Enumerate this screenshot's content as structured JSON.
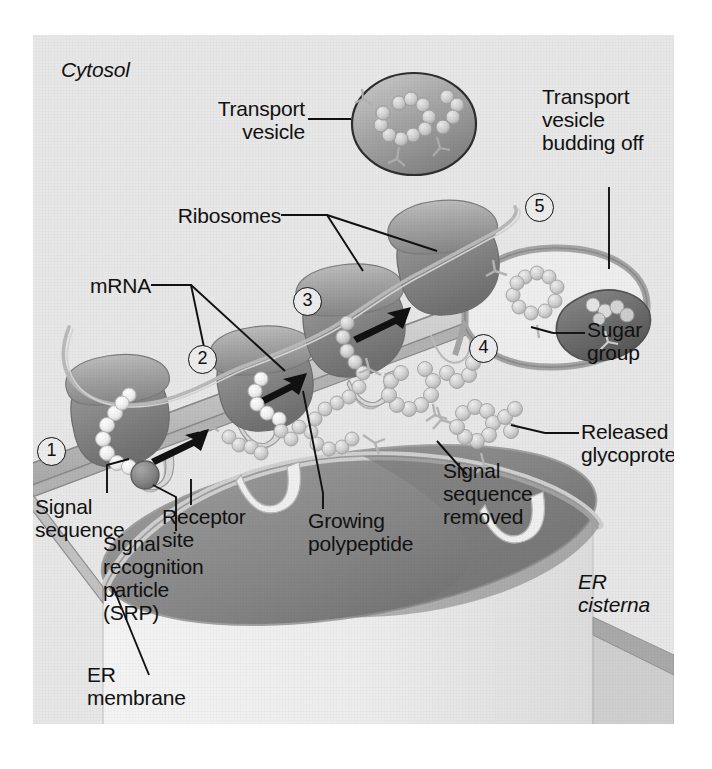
{
  "figure": {
    "title_visible": false,
    "compartments": {
      "cytosol": "Cytosol",
      "er_cisterna": "ER\ncisterna"
    },
    "labels": {
      "transport_vesicle": "Transport\nvesicle",
      "transport_vesicle_budding": "Transport\nvesicle\nbudding off",
      "ribosomes": "Ribosomes",
      "mrna": "mRNA",
      "signal_sequence": "Signal\nsequence",
      "receptor_site": "Receptor\nsite",
      "srp": "Signal\nrecognition\nparticle\n(SRP)",
      "er_membrane": "ER\nmembrane",
      "growing_polypeptide": "Growing\npolypeptide",
      "signal_sequence_removed": "Signal\nsequence\nremoved",
      "sugar_group": "Sugar\ngroup",
      "released_glycoprotein": "Released\nglycoprotein"
    },
    "steps": [
      {
        "number": "1"
      },
      {
        "number": "2"
      },
      {
        "number": "3"
      },
      {
        "number": "4"
      },
      {
        "number": "5"
      }
    ],
    "colors": {
      "background": "#e7e7e7",
      "page": "#ffffff",
      "ribosome_dark": "#8a8a8a",
      "ribosome_light": "#a9a9a9",
      "membrane": "#c9c9c9",
      "membrane_edge": "#8e8e8e",
      "cisterna_interior": "#8c8c8c",
      "cisterna_wall": "#efefef",
      "bead": "#cdcdcd",
      "bead_white": "#f4f4f4",
      "srp": "#7d7d7d",
      "vesicle": "#9a9a9a",
      "leader_line": "#111111",
      "text": "#111111"
    },
    "icon_names": {
      "arrow": "arrow-right-icon",
      "circled_number": "circled-number-icon",
      "bead_chain": "polypeptide-bead-chain-icon",
      "sugar": "sugar-group-branch-icon"
    }
  }
}
